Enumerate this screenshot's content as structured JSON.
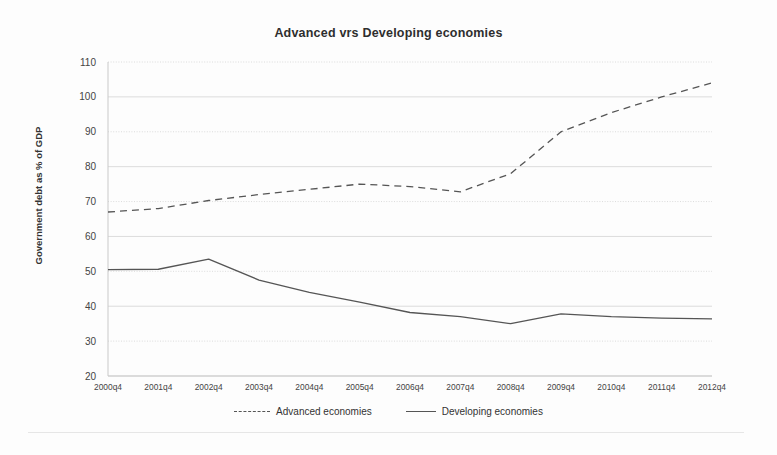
{
  "chart_data": {
    "type": "line",
    "title": "Advanced vrs Developing economies",
    "xlabel": "",
    "ylabel": "Government debt as % of GDP",
    "categories": [
      "2000q4",
      "2001q4",
      "2002q4",
      "2003q4",
      "2004q4",
      "2005q4",
      "2006q4",
      "2007q4",
      "2008q4",
      "2009q4",
      "2010q4",
      "2011q4",
      "2012q4"
    ],
    "ylim": [
      20,
      110
    ],
    "yticks": [
      20,
      30,
      40,
      50,
      60,
      70,
      80,
      90,
      100,
      110
    ],
    "grid": true,
    "grid_axis": "y",
    "legend_position": "bottom",
    "series": [
      {
        "name": "Advanced economies",
        "style": "dashed",
        "color": "#555555",
        "values": [
          67.0,
          68.0,
          70.3,
          72.0,
          73.5,
          75.0,
          74.3,
          72.8,
          78.0,
          90.0,
          95.5,
          100.0,
          104.0
        ]
      },
      {
        "name": "Developing economies",
        "style": "solid",
        "color": "#555555",
        "values": [
          50.5,
          50.6,
          53.5,
          47.5,
          44.0,
          41.2,
          38.2,
          37.0,
          35.0,
          37.8,
          37.0,
          36.6,
          36.4
        ]
      }
    ]
  },
  "legend": {
    "entries": [
      {
        "label": "Advanced economies"
      },
      {
        "label": "Developing economies"
      }
    ]
  }
}
